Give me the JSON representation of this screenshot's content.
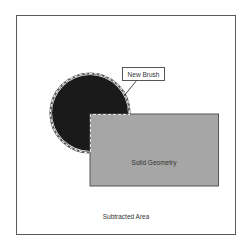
{
  "diagram": {
    "labels": {
      "new_brush": "New Brush",
      "solid_geometry": "Solid Geometry",
      "subtracted_area": "Subtracted Area"
    },
    "colors": {
      "frame": "#5a5a5a",
      "brush_fill": "#1a1a1a",
      "solid_fill": "#a6a6a6",
      "solid_stroke": "#555555",
      "dashed_outline": "#d8d8d8"
    }
  }
}
